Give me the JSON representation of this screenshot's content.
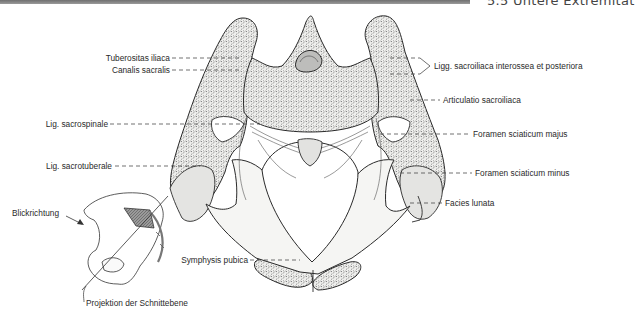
{
  "header": {
    "section_title": "5.5 Untere Extremität"
  },
  "figure": {
    "labels": {
      "tuberositas_iliaca": "Tuberositas iliaca",
      "canalis_sacralis": "Canalis sacralis",
      "ligg_sacroiliaca": "Ligg. sacroiliaca interossea et posteriora",
      "articulatio_sacroiliaca": "Articulatio sacroiliaca",
      "lig_sacrospinale": "Lig. sacrospinale",
      "foramen_majus": "Foramen sciaticum majus",
      "lig_sacrotuberale": "Lig. sacrotuberale",
      "foramen_minus": "Foramen sciaticum minus",
      "facies_lunata": "Facies lunata",
      "symphysis_pubica": "Symphysis pubica"
    },
    "inset": {
      "blickrichtung": "Blickrichtung",
      "projektion": "Projektion der Schnittebene"
    }
  },
  "colors": {
    "header_bar": "#7a7a7a",
    "bone_fill": "#f4f4f2",
    "bone_stroke": "#2a2a2a",
    "spongiosa": "#5a5a5a",
    "inset_shade": "#8a8a8a"
  }
}
